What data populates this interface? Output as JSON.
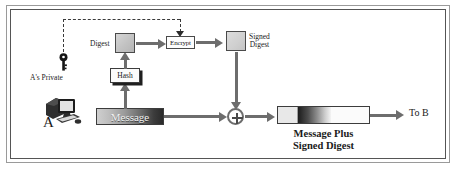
{
  "diagram": {
    "frame": {
      "style": "double-border"
    }
  },
  "nodes": {
    "digest": {
      "label": "Digest",
      "icon": "digest-block-icon"
    },
    "hash": {
      "label": "Hash"
    },
    "encrypt": {
      "label": "Encrypt"
    },
    "signed_digest": {
      "label": "Signed\nDigest",
      "line1": "Signed",
      "line2": "Digest"
    },
    "message": {
      "label": "Message"
    },
    "combined": {
      "caption_line1": "Message Plus",
      "caption_line2": "Signed Digest"
    },
    "combiner": {
      "symbol": "+",
      "name": "concatenation-operator"
    },
    "destination": {
      "label": "To B"
    }
  },
  "actor": {
    "name": "A",
    "icon": "computer-workstation-icon",
    "key_label": "A's Private",
    "key_icon": "key-icon"
  },
  "colors": {
    "line": "#6d6d6d",
    "frame_outer": "#9a9a9a",
    "frame_inner": "#555555",
    "text": "#1a1a1a",
    "digest_fill": "#c6c6c6",
    "dash": "#3a3a3a"
  },
  "connections": [
    {
      "from": "message",
      "to": "hash",
      "style": "solid-arrow-up"
    },
    {
      "from": "hash",
      "to": "digest",
      "style": "solid-arrow-up"
    },
    {
      "from": "digest",
      "to": "encrypt",
      "style": "solid-arrow-right"
    },
    {
      "from": "private_key",
      "to": "encrypt",
      "style": "dashed-arrow-down"
    },
    {
      "from": "encrypt",
      "to": "signed_digest",
      "style": "solid-arrow-right"
    },
    {
      "from": "signed_digest",
      "to": "combiner",
      "style": "solid-arrow-down"
    },
    {
      "from": "message",
      "to": "combiner",
      "style": "solid-arrow-right"
    },
    {
      "from": "combiner",
      "to": "combined",
      "style": "solid-arrow-right"
    },
    {
      "from": "combined",
      "to": "destination",
      "style": "solid-arrow-right"
    }
  ]
}
